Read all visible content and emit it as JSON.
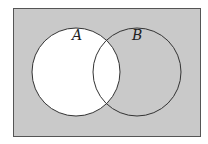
{
  "diagram": {
    "type": "venn",
    "universe": {
      "x": 13,
      "y": 8,
      "width": 187,
      "height": 128,
      "fill": "#c9c9c9",
      "stroke": "#555555"
    },
    "sets": [
      {
        "label": "A",
        "cx": 76,
        "cy": 72,
        "r": 44,
        "fill": "#ffffff",
        "label_x": 72,
        "label_y": 40
      },
      {
        "label": "B",
        "cx": 137,
        "cy": 72,
        "r": 44,
        "fill": "none",
        "label_x": 132,
        "label_y": 40
      }
    ],
    "shaded_region": "complement of A",
    "stroke_color": "#333333"
  }
}
